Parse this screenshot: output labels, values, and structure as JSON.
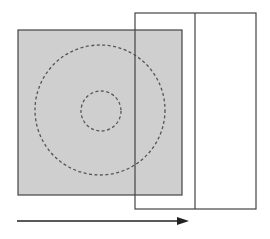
{
  "diagram": {
    "colors": {
      "background": "#ffffff",
      "square_fill": "#cfcfcf",
      "stroke": "#444444",
      "dash": "#555555"
    },
    "shapes": {
      "gray_square": {
        "x": 18,
        "y": 30,
        "w": 164,
        "h": 165
      },
      "outer_circle": {
        "cx": 100,
        "cy": 110,
        "r": 65
      },
      "inner_circle": {
        "cx": 101,
        "cy": 111,
        "r": 20
      },
      "overlay_rect": {
        "x": 135,
        "y": 13,
        "w": 121,
        "h": 196,
        "divider_x": 195
      },
      "arrow": {
        "x1": 17,
        "y1": 221,
        "x2": 188,
        "y2": 221,
        "direction": "right"
      }
    }
  }
}
